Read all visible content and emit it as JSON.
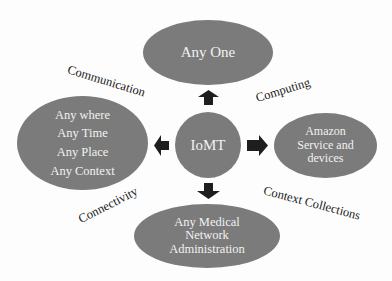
{
  "diagram": {
    "type": "hub-and-spoke",
    "center": {
      "label": "IoMT"
    },
    "nodes": {
      "top": {
        "lines": [
          "Any One"
        ]
      },
      "left": {
        "lines": [
          "Any where",
          "Any Time",
          "Any Place",
          "Any Context"
        ]
      },
      "right": {
        "lines": [
          "Amazon",
          "Service and",
          "devices"
        ]
      },
      "bottom": {
        "lines": [
          "Any Medical",
          "Network",
          "Administration"
        ]
      }
    },
    "edge_labels": {
      "top_left": "Communication",
      "top_right": "Computing",
      "bottom_left": "Connectivity",
      "bottom_right": "Context Collections"
    },
    "arrows": [
      "up",
      "left",
      "right",
      "down"
    ],
    "colors": {
      "node_fill": "#7b7b7b",
      "node_text": "#f2f2f2",
      "arrow_fill": "#1e1e1e",
      "label_text": "#1a1a1a",
      "background": "#ffffff"
    }
  }
}
